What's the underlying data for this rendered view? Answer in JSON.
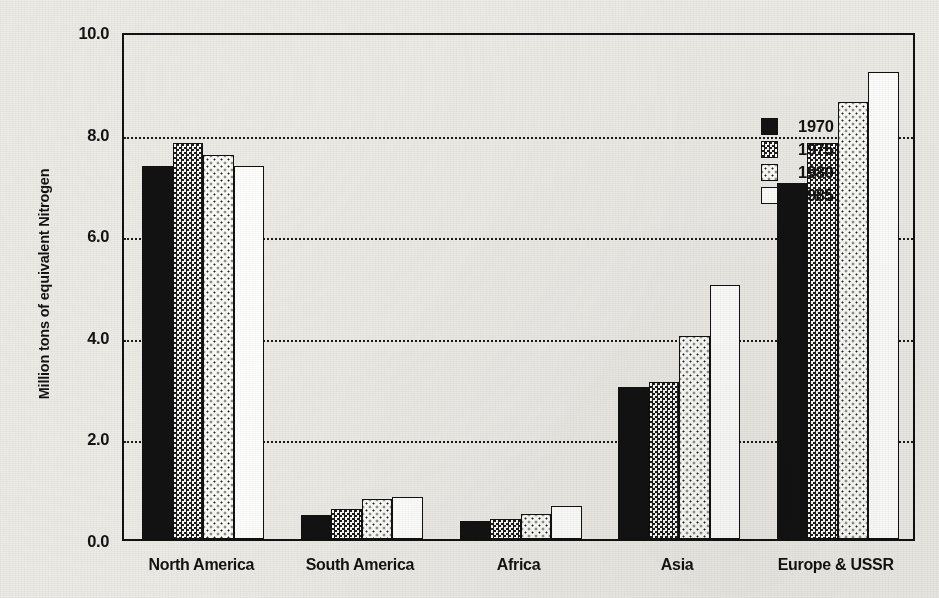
{
  "chart_data": {
    "type": "bar",
    "title": "",
    "xlabel": "",
    "ylabel": "Million tons of equivalent Nitrogen",
    "ylim": [
      0.0,
      10.0
    ],
    "ytick_labels": [
      "0.0",
      "2.0",
      "4.0",
      "6.0",
      "8.0",
      "10.0"
    ],
    "ytick_values": [
      0.0,
      2.0,
      4.0,
      6.0,
      8.0,
      10.0
    ],
    "grid": "horizontal dotted gridlines at 2.0, 4.0, 6.0, 8.0",
    "legend_position": "upper right inside plot",
    "categories": [
      "North America",
      "South America",
      "Africa",
      "Asia",
      "Europe & USSR"
    ],
    "series": [
      {
        "name": "1970",
        "fill": "solid-black",
        "values": [
          7.35,
          0.48,
          0.35,
          3.0,
          7.0
        ]
      },
      {
        "name": "1975",
        "fill": "dense-checker",
        "values": [
          7.8,
          0.6,
          0.4,
          3.1,
          7.8
        ]
      },
      {
        "name": "1980",
        "fill": "light-dots",
        "values": [
          7.55,
          0.78,
          0.5,
          4.0,
          8.6
        ]
      },
      {
        "name": "1985",
        "fill": "white",
        "values": [
          7.35,
          0.82,
          0.65,
          5.0,
          9.2
        ]
      }
    ]
  },
  "legend": {
    "items": [
      {
        "label": "1970",
        "swatch": "solid-black-swatch"
      },
      {
        "label": "1975",
        "swatch": "dense-checker-swatch"
      },
      {
        "label": "1980",
        "swatch": "light-dots-swatch"
      },
      {
        "label": "1985",
        "swatch": "white-swatch"
      }
    ]
  },
  "colors": {
    "ink": "#121212",
    "paper": "#eceae5",
    "bar_face": "#fdfdfb"
  }
}
